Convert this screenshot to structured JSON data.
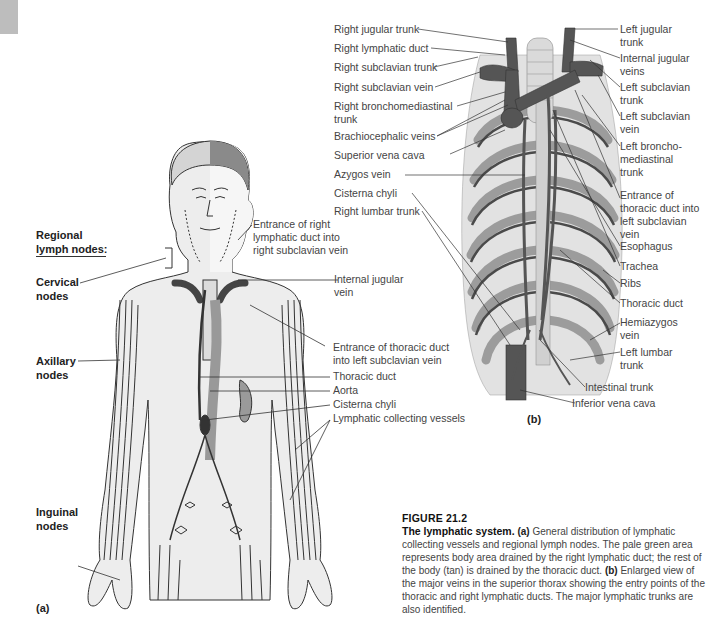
{
  "figure": {
    "number_label": "FIGURE 21.2",
    "title": "The lymphatic system.",
    "caption_parts": [
      {
        "bold": "(a)",
        "text": " General distribution of lymphatic collecting vessels and regional lymph nodes. The pale green area represents body area drained by the right lymphatic duct; the rest of the body (tan) is drained by the thoracic duct. "
      },
      {
        "bold": "(b)",
        "text": " Enlarged view of the major veins in the superior thorax showing the entry points of the thoracic and right lymphatic ducts. The major lymphatic trunks are also identified."
      }
    ]
  },
  "panel_a": {
    "letter": "(a)",
    "regional_heading": "Regional lymph nodes:",
    "node_labels": {
      "cervical": "Cervical nodes",
      "axillary": "Axillary nodes",
      "inguinal": "Inguinal nodes"
    },
    "right_labels": {
      "entrance_right_duct": "Entrance of right lymphatic duct into right subclavian vein",
      "internal_jugular": "Internal jugular vein",
      "entrance_thoracic": "Entrance of thoracic duct into left subclavian vein",
      "thoracic_duct": "Thoracic duct",
      "aorta": "Aorta",
      "cisterna_chyli": "Cisterna chyli",
      "collecting_vessels": "Lymphatic collecting vessels"
    }
  },
  "panel_b": {
    "letter": "(b)",
    "left_labels": [
      "Right jugular trunk",
      "Right lymphatic duct",
      "Right subclavian trunk",
      "Right subclavian vein",
      "Right bronchomediastinal trunk",
      "Brachiocephalic veins",
      "Superior vena cava",
      "Azygos vein",
      "Cisterna chyli",
      "Right lumbar trunk"
    ],
    "right_labels": [
      "Left jugular trunk",
      "Internal jugular veins",
      "Left subclavian trunk",
      "Left subclavian vein",
      "Left broncho-mediastinal trunk",
      "Entrance of thoracic duct into left subclavian vein",
      "Esophagus",
      "Trachea",
      "Ribs",
      "Thoracic duct",
      "Hemiazygos vein",
      "Left lumbar trunk"
    ],
    "bottom_labels": [
      "Intestinal trunk",
      "Inferior vena cava"
    ]
  },
  "colors": {
    "vein": "#5a5a5a",
    "rib_light": "#d9d9d9",
    "rib_dark": "#9a9a9a",
    "body_tan": "#ececec",
    "body_green": "#f3f3f3",
    "line": "#333333"
  }
}
